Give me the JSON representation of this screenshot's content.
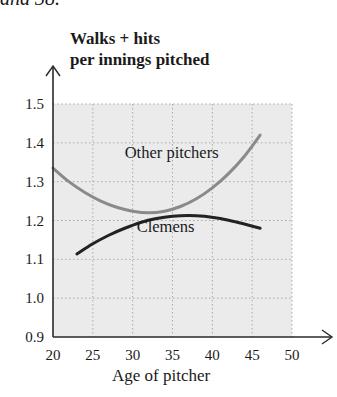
{
  "page": {
    "top_fragment": "and 38."
  },
  "chart_data": {
    "type": "line",
    "title": "",
    "ylabel": [
      "Walks + hits",
      "per innings pitched"
    ],
    "xlabel": "Age of pitcher",
    "xlim": [
      20,
      50
    ],
    "ylim": [
      0.9,
      1.5
    ],
    "xticks": [
      20,
      25,
      30,
      35,
      40,
      45,
      50
    ],
    "xtick_labels": [
      "20",
      "25",
      "30",
      "35",
      "40",
      "45",
      "50"
    ],
    "yticks": [
      0.9,
      1.0,
      1.1,
      1.2,
      1.3,
      1.4,
      1.5
    ],
    "ytick_labels": [
      "0.9",
      "1.0",
      "1.1",
      "1.2",
      "1.3",
      "1.4",
      "1.5"
    ],
    "grid": true,
    "grid_style": "dotted",
    "plot_background": "#ebebeb",
    "legend": "inline labels",
    "series": [
      {
        "name": "Other pitchers",
        "color": "#8a8a8a",
        "x": [
          20,
          22,
          24,
          26,
          28,
          30,
          32,
          34,
          36,
          38,
          40,
          42,
          44,
          46
        ],
        "values": [
          1.335,
          1.3,
          1.272,
          1.25,
          1.234,
          1.224,
          1.22,
          1.224,
          1.236,
          1.256,
          1.284,
          1.32,
          1.365,
          1.42
        ],
        "label_position": {
          "x": 29,
          "y": 1.36
        }
      },
      {
        "name": "Clemens",
        "color": "#222222",
        "x": [
          23,
          25,
          27,
          29,
          31,
          33,
          35,
          37,
          39,
          41,
          43,
          46
        ],
        "values": [
          1.114,
          1.14,
          1.162,
          1.18,
          1.195,
          1.205,
          1.211,
          1.213,
          1.211,
          1.205,
          1.196,
          1.18
        ],
        "label_position": {
          "x": 30.5,
          "y": 1.17
        }
      }
    ],
    "axes": {
      "arrows": true
    }
  }
}
